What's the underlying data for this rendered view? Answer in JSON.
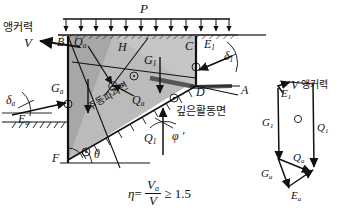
{
  "figure": {
    "type": "geotechnical-stability-diagram",
    "title_korean_terms": [
      "앵커력",
      "주동파괴면",
      "깊은활동면"
    ]
  },
  "colors": {
    "soil_wedge_light": "#c9c9c9",
    "soil_wedge_dark": "#9f9f9f",
    "ground_line": "#1a1a1a",
    "line": "#111111",
    "anchor_bar": "#6e6e6e",
    "background": "#ffffff"
  },
  "loads": {
    "surcharge_label": "P",
    "arrow_count": 12
  },
  "anchor": {
    "korean_label": "앵커력",
    "force_label": "V"
  },
  "points": {
    "B": "B",
    "C": "C",
    "D": "D",
    "A": "A",
    "F": "F",
    "H": "H"
  },
  "forces": {
    "Qa": "Q",
    "Qa_sub": "a",
    "Q1": "Q",
    "Q1_sub": "1",
    "Ga": "G",
    "Ga_sub": "a",
    "G1": "G",
    "G1_sub": "1",
    "Ea": "E",
    "Ea_sub": "a",
    "E1": "E",
    "E1_sub": "1"
  },
  "angles": {
    "delta_a": "δ",
    "delta_a_sub": "a",
    "delta_1": "δ",
    "delta_1_sub": "1",
    "theta": "θ",
    "phi_prime": "φ ′"
  },
  "surfaces": {
    "active_failure_plane": "주동파괴면",
    "deep_slip_surface": "깊은활동면"
  },
  "equation": {
    "eta": "η",
    "equals": "=",
    "numerator": "V",
    "numerator_sub": "a",
    "denominator": "V",
    "relation": "≥",
    "value": "1.5"
  },
  "polygon": {
    "caption_force": "V",
    "caption_korean": "앵커력",
    "vectors": [
      "E1",
      "G1",
      "Q1",
      "Ga",
      "Qa",
      "Ea"
    ]
  }
}
